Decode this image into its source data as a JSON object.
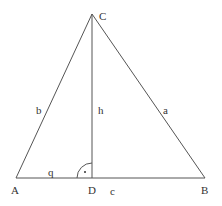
{
  "diagram": {
    "type": "triangle-with-altitude",
    "colors": {
      "line": "#555555",
      "text": "#333333",
      "background": "#ffffff"
    },
    "points": {
      "A": {
        "label": "A",
        "x": 16,
        "y": 178
      },
      "B": {
        "label": "B",
        "x": 205,
        "y": 178
      },
      "C": {
        "label": "C",
        "x": 92,
        "y": 14
      },
      "D": {
        "label": "D",
        "x": 92,
        "y": 178
      }
    },
    "sides": {
      "a": {
        "label": "a",
        "from": "B",
        "to": "C"
      },
      "b": {
        "label": "b",
        "from": "A",
        "to": "C"
      },
      "c": {
        "label": "c",
        "from": "A",
        "to": "B"
      },
      "h": {
        "label": "h",
        "from": "C",
        "to": "D"
      },
      "q": {
        "label": "q",
        "from": "A",
        "to": "D"
      }
    },
    "right_angle_marker": {
      "at": "D",
      "symbol": "•"
    }
  }
}
